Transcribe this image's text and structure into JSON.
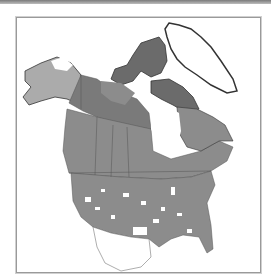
{
  "map": {
    "title": "",
    "region": "North America",
    "style": "grayscale distribution map",
    "colors": {
      "background": "#ffffff",
      "frame": "#9a9a9a",
      "light_range": "#ababab",
      "main_range": "#8c8c8c",
      "dark_range": "#6b6b6b",
      "coast": "#333333",
      "borders": "#555555"
    }
  }
}
